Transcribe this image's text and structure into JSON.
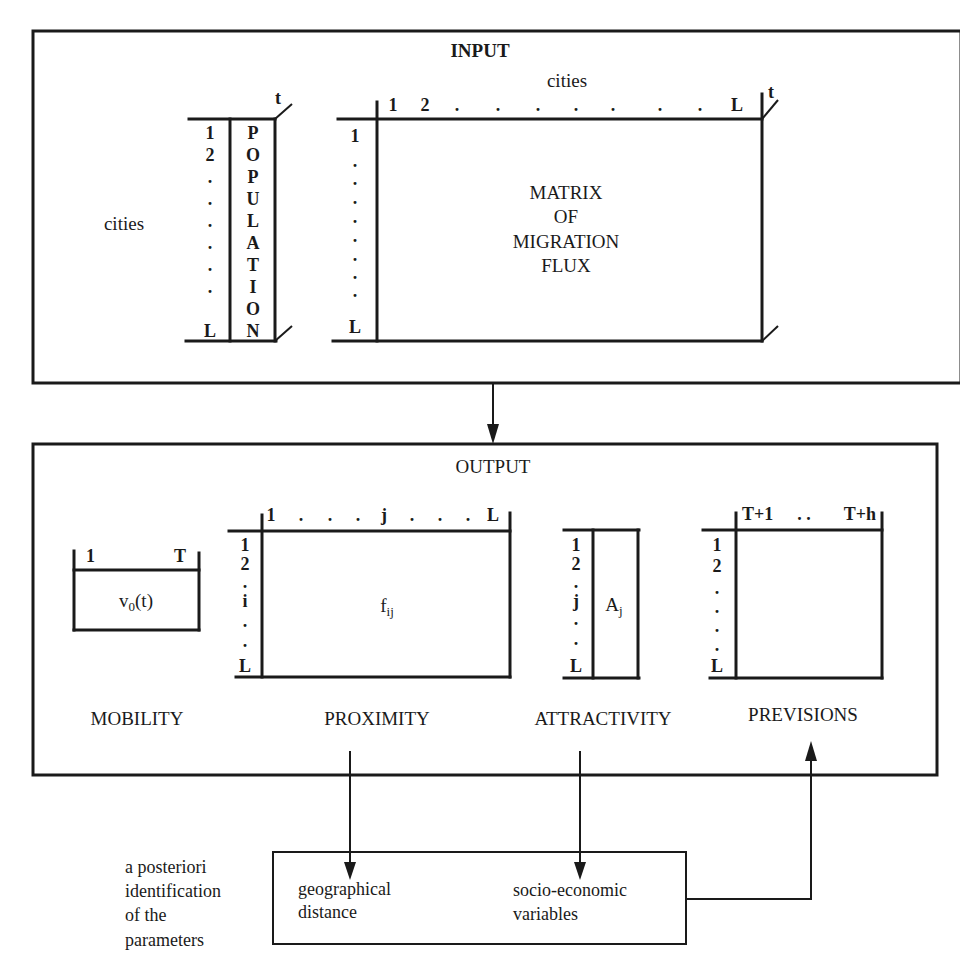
{
  "input": {
    "title": "INPUT",
    "cities_label_left": "cities",
    "cities_label_top": "cities",
    "time_axis": "t",
    "population_vector": {
      "row_labels": [
        "1",
        "2",
        ".",
        ".",
        ".",
        ".",
        ".",
        ".",
        "L"
      ],
      "vertical_text": [
        "P",
        "O",
        "P",
        "U",
        "L",
        "A",
        "T",
        "I",
        "O",
        "N"
      ],
      "time_label": "t"
    },
    "migration_matrix": {
      "col_labels": [
        "1",
        "2",
        ".",
        ".",
        ".",
        ".",
        ".",
        ".",
        ".",
        "L"
      ],
      "row_labels": [
        "1",
        ".",
        ".",
        ".",
        ".",
        ".",
        ".",
        ".",
        ".",
        "L"
      ],
      "lines": [
        "MATRIX",
        "OF",
        "MIGRATION",
        "FLUX"
      ],
      "time_label": "t"
    }
  },
  "output": {
    "title": "OUTPUT",
    "mobility": {
      "label": "MOBILITY",
      "start": "1",
      "end": "T",
      "cell": "v",
      "cell_sub": "0",
      "cell_arg": "(t)"
    },
    "proximity": {
      "label": "PROXIMITY",
      "col_labels": [
        "1",
        ".",
        ".",
        ".",
        "j",
        ".",
        ".",
        ".",
        "L"
      ],
      "row_labels": [
        "1",
        "2",
        ".",
        "i",
        ".",
        ".",
        "L"
      ],
      "cell": "f",
      "cell_sub": "ij"
    },
    "attractivity": {
      "label": "ATTRACTIVITY",
      "row_labels": [
        "1",
        "2",
        ".",
        "j",
        ".",
        ".",
        "L"
      ],
      "cell": "A",
      "cell_sub": "j"
    },
    "previsions": {
      "label": "PREVISIONS",
      "col_start": "T+1",
      "col_dots": ". .",
      "col_end": "T+h",
      "row_labels": [
        "1",
        "2",
        ".",
        ".",
        ".",
        ".",
        "L"
      ]
    }
  },
  "identification": {
    "side_label": [
      "a posteriori",
      "identification",
      "of the",
      "parameters"
    ],
    "geographical": [
      "geographical",
      "distance"
    ],
    "socio_economic": [
      "socio-economic",
      "variables"
    ]
  }
}
